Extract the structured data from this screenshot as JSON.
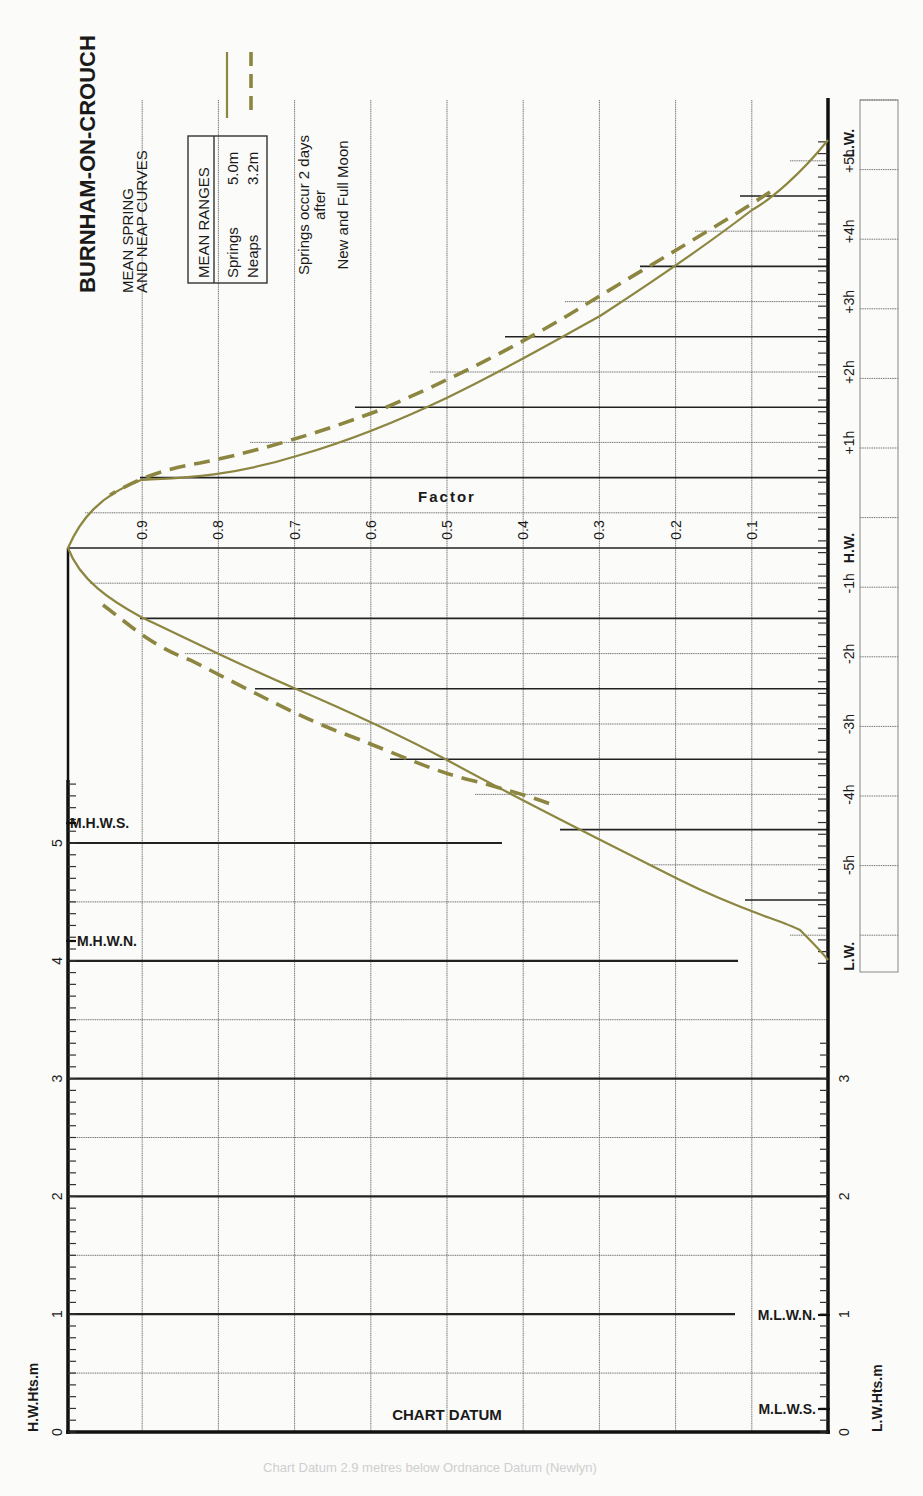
{
  "title": "BURNHAM-ON-CROUCH",
  "subtitle_line1": "MEAN SPRING",
  "subtitle_line2": "AND NEAP CURVES",
  "mean_ranges": {
    "header": "MEAN RANGES",
    "springs_label": "Springs",
    "springs_value": "5.0m",
    "neaps_label": "Neaps",
    "neaps_value": "3.2m"
  },
  "note": {
    "line1": "Springs occur 2 days",
    "line2": "after",
    "line3": "New and Full Moon"
  },
  "factor_label": "Factor",
  "factor_ticks": [
    "0.9",
    "0.8",
    "0.7",
    "0.6",
    "0.5",
    "0.4",
    "0.3",
    "0.2",
    "0.1"
  ],
  "time_labels": {
    "lw_top": "L.W.",
    "p5": "+5h",
    "p4": "+4h",
    "p3": "+3h",
    "p2": "+2h",
    "p1": "+1h",
    "hw": "H.W.",
    "m1": "-1h",
    "m2": "-2h",
    "m3": "-3h",
    "m4": "-4h",
    "m5": "-5h",
    "lw_bottom": "L.W."
  },
  "height_axis": {
    "left_label": "H.W.Hts.m",
    "right_label": "L.W.Hts.m",
    "ticks": [
      "0",
      "1",
      "2",
      "3",
      "4",
      "5"
    ],
    "right_ticks": [
      "0",
      "1",
      "2",
      "3"
    ],
    "mhws": "M.H.W.S.",
    "mhwn": "M.H.W.N.",
    "mlwn": "M.L.W.N.",
    "mlws": "M.L.W.S.",
    "chart_datum": "CHART DATUM"
  },
  "legend": {
    "springs": "Springs (solid)",
    "neaps": "Neaps (dashed)"
  },
  "colors": {
    "curve": "#8c8640",
    "grid": "#222222",
    "background": "#fbfbf9"
  },
  "chart_data": {
    "type": "line",
    "xlabel": "Time relative to H.W. (hours)",
    "ylabel": "Factor",
    "x": [
      -5.9,
      -5,
      -4,
      -3,
      -2,
      -1,
      0,
      1,
      2,
      3,
      4,
      5,
      5.85
    ],
    "series": [
      {
        "name": "Springs",
        "style": "solid",
        "values": [
          0.0,
          0.08,
          0.28,
          0.5,
          0.72,
          0.9,
          1.0,
          0.88,
          0.66,
          0.45,
          0.23,
          0.08,
          0.0
        ]
      },
      {
        "name": "Neaps",
        "style": "dashed",
        "x": [
          -3.6,
          -3,
          -2,
          -1.2,
          1.1,
          2,
          3,
          4,
          5
        ],
        "values": [
          0.37,
          0.53,
          0.76,
          0.92,
          0.91,
          0.7,
          0.49,
          0.27,
          0.08
        ]
      }
    ],
    "ylim": [
      0,
      1
    ],
    "factor_ticks": [
      0.1,
      0.2,
      0.3,
      0.4,
      0.5,
      0.6,
      0.7,
      0.8,
      0.9
    ],
    "height_scale": {
      "hw_heights_m": [
        0,
        1,
        2,
        3,
        4,
        5
      ],
      "lw_heights_m": [
        0,
        1,
        2,
        3
      ],
      "MHWS": 5.3,
      "MHWN": 4.2,
      "MLWN": 1.0,
      "MLWS": 0.3
    },
    "mean_ranges": {
      "springs_m": 5.0,
      "neaps_m": 3.2
    },
    "grid": true,
    "legend_position": "top"
  }
}
